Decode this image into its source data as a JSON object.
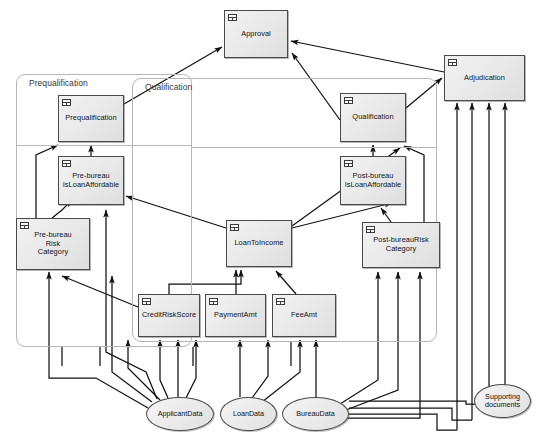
{
  "diagram": {
    "type": "dmn-decision-requirements-diagram",
    "icon_names": {
      "decision_table": "decision-table-icon"
    },
    "colors": {
      "node_fill": "#ebebeb",
      "node_stroke": "#4a4a4a",
      "group_stroke": "#b6b6b6",
      "connector": "#111111",
      "background": "#ffffff"
    }
  },
  "groups": [
    {
      "id": "prequalification-group",
      "label": "Prequalification",
      "x": 16,
      "y": 74,
      "w": 176,
      "h": 273
    },
    {
      "id": "qualification-group",
      "label": "Qualification",
      "x": 132,
      "y": 78,
      "w": 305,
      "h": 264
    }
  ],
  "dividers": [
    {
      "id": "prequalification-divider",
      "x": 16,
      "y": 145,
      "w": 176
    },
    {
      "id": "qualification-divider",
      "x": 192,
      "y": 147,
      "w": 245
    }
  ],
  "decisions": [
    {
      "id": "approval",
      "label": "Approval",
      "x": 224,
      "y": 10,
      "w": 64,
      "h": 48
    },
    {
      "id": "adjudication",
      "label": "Adjudication",
      "x": 444,
      "y": 55,
      "w": 81,
      "h": 46
    },
    {
      "id": "prequalification",
      "label": "Prequalification",
      "x": 58,
      "y": 95,
      "w": 66,
      "h": 47
    },
    {
      "id": "qualification",
      "label": "Qualification",
      "x": 340,
      "y": 93,
      "w": 66,
      "h": 49
    },
    {
      "id": "pre-bureau-affordable",
      "label": "Pre-bureau\nIsLoanAffordable",
      "x": 58,
      "y": 156,
      "w": 66,
      "h": 49
    },
    {
      "id": "post-bureau-affordable",
      "label": "Post-bureau\nIsLoanAffordable",
      "x": 340,
      "y": 156,
      "w": 66,
      "h": 49
    },
    {
      "id": "pre-bureau-risk",
      "label": "Pre-bureau\nRisk\nCategory",
      "x": 16,
      "y": 218,
      "w": 74,
      "h": 52
    },
    {
      "id": "loan-to-income",
      "label": "LoanToIncome",
      "x": 226,
      "y": 220,
      "w": 66,
      "h": 47
    },
    {
      "id": "post-bureau-risk",
      "label": "Post-bureauRisk\nCategory",
      "x": 362,
      "y": 222,
      "w": 78,
      "h": 46
    },
    {
      "id": "credit-risk-score",
      "label": "CreditRiskScore",
      "x": 138,
      "y": 294,
      "w": 62,
      "h": 43
    },
    {
      "id": "payment-amt",
      "label": "PaymentAmt",
      "x": 205,
      "y": 294,
      "w": 61,
      "h": 43
    },
    {
      "id": "fee-amt",
      "label": "FeeAmt",
      "x": 272,
      "y": 294,
      "w": 64,
      "h": 43
    }
  ],
  "input_data": [
    {
      "id": "applicant-data",
      "label": "ApplicantData",
      "x": 146,
      "y": 397,
      "w": 68,
      "h": 34
    },
    {
      "id": "loan-data",
      "label": "LoanData",
      "x": 220,
      "y": 397,
      "w": 57,
      "h": 34
    },
    {
      "id": "bureau-data",
      "label": "BureauData",
      "x": 282,
      "y": 397,
      "w": 67,
      "h": 34
    },
    {
      "id": "supporting-documents",
      "label": "Supporting\ndocuments",
      "x": 474,
      "y": 384,
      "w": 57,
      "h": 34
    }
  ]
}
